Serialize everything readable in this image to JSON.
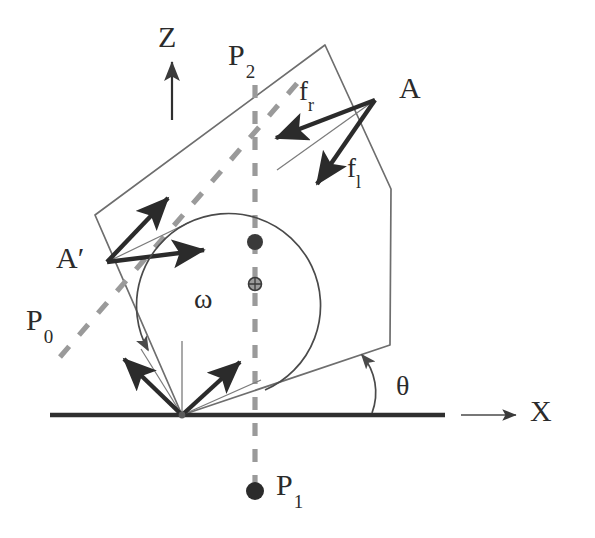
{
  "figure": {
    "kind": "mechanics-free-body-diagram",
    "background_color": "#ffffff",
    "ink_color": "#2b2b2b",
    "dashed_color": "#9a9a9a",
    "thin_line_color": "#6e6e6e"
  },
  "axes": {
    "z_label": "Z",
    "x_label": "X",
    "origin_label": "",
    "z_arrow": {
      "x": 172,
      "y_top": 60,
      "y_bottom": 118
    },
    "x_arrow": {
      "y": 415,
      "x_start": 455,
      "x_end": 520
    },
    "ground_line": {
      "y": 415,
      "x_start": 50,
      "x_end": 445
    }
  },
  "points": {
    "A": {
      "label": "A",
      "x": 375,
      "y": 100,
      "label_x": 399,
      "label_y": 76
    },
    "A_prime": {
      "label": "A′",
      "x": 107,
      "y": 262,
      "label_x": 58,
      "label_y": 246
    },
    "P0": {
      "label": "P",
      "subscript": "0",
      "label_x": 30,
      "label_y": 320
    },
    "P1": {
      "label": "P",
      "subscript": "1",
      "dot_x": 255,
      "dot_y": 491,
      "label_x": 274,
      "label_y": 474
    },
    "P2": {
      "label": "P",
      "subscript": "2",
      "label_x": 229,
      "label_y": 44
    },
    "dot_upper": {
      "x": 255,
      "y": 242,
      "r": 8,
      "fill": "#3a3a3a"
    },
    "dot_lower": {
      "x": 255,
      "y": 284,
      "r": 6.5,
      "fill": "#7a7a7a"
    }
  },
  "forces": {
    "f_r": {
      "label": "f",
      "subscript": "r",
      "label_x": 300,
      "label_y": 82,
      "from_x": 375,
      "from_y": 100,
      "to_x": 272,
      "to_y": 139
    },
    "f_l": {
      "label": "f",
      "subscript": "l",
      "label_x": 348,
      "label_y": 160,
      "from_x": 375,
      "from_y": 100,
      "to_x": 314,
      "to_y": 187
    }
  },
  "angles": {
    "omega": {
      "label": "ω",
      "label_x": 196,
      "label_y": 289
    },
    "theta": {
      "label": "θ",
      "label_x": 398,
      "label_y": 377
    }
  },
  "body_polygon": {
    "description": "tilted convex polygon (rigid body)",
    "vertices": [
      [
        95,
        215
      ],
      [
        325,
        45
      ],
      [
        391,
        189
      ],
      [
        390,
        345
      ],
      [
        182,
        415
      ]
    ],
    "stroke": "#6e6e6e",
    "fill": "none"
  },
  "dashed_lines": {
    "vertical_P2_P1": {
      "x": 255,
      "y_top": 85,
      "y_bottom": 483,
      "color": "#9a9a9a"
    },
    "diagonal_P0_P2": {
      "x1": 60,
      "y1": 357,
      "x2": 300,
      "y2": 80,
      "color": "#9a9a9a"
    }
  },
  "arrows_at_A_prime": [
    {
      "name": "upper-right-arrow",
      "from_x": 107,
      "from_y": 262,
      "to_x": 166,
      "to_y": 196
    },
    {
      "name": "right-arrow",
      "from_x": 107,
      "from_y": 262,
      "to_x": 203,
      "to_y": 249
    }
  ],
  "arrows_at_origin": [
    {
      "name": "up-left-arrow",
      "from_x": 182,
      "from_y": 415,
      "to_x": 123,
      "to_y": 357
    },
    {
      "name": "up-right-arrow",
      "from_x": 182,
      "from_y": 415,
      "to_x": 240,
      "to_y": 360
    }
  ],
  "thin_rays": [
    {
      "name": "ray-A-to-lower-left",
      "x1": 375,
      "y1": 100,
      "x2": 277,
      "y2": 170
    },
    {
      "name": "ray-Aprime-to-upper-right",
      "x1": 107,
      "y1": 262,
      "x2": 188,
      "y2": 223
    },
    {
      "name": "ray-origin-vertical",
      "x1": 182,
      "y1": 415,
      "x2": 182,
      "y2": 341
    },
    {
      "name": "ray-origin-upleft-thin",
      "x1": 182,
      "y1": 415,
      "x2": 140,
      "y2": 348
    },
    {
      "name": "ray-origin-upright-thin",
      "x1": 182,
      "y1": 415,
      "x2": 258,
      "y2": 381
    }
  ]
}
